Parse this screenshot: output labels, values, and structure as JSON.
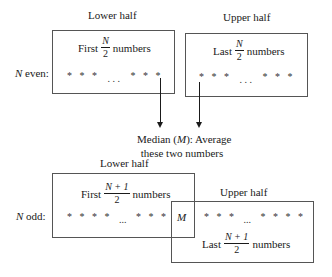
{
  "even": {
    "row_label_var": "N",
    "row_label_rest": " even:",
    "lower": {
      "caption": "Lower half",
      "prefix": "First",
      "frac_num": "N",
      "frac_den": "2",
      "suffix": "numbers",
      "stars_left": "*   *   *",
      "ellipsis": ". . .",
      "stars_right": "*   *   *"
    },
    "upper": {
      "caption": "Upper half",
      "prefix": "Last",
      "frac_num": "N",
      "frac_den": "2",
      "suffix": "numbers",
      "stars_left": "*   *   *",
      "ellipsis": ". . .",
      "stars_right": "*   *   *"
    },
    "median_note_line1_pre": "Median (",
    "median_note_M": "M",
    "median_note_line1_post": "): Average",
    "median_note_line2": "these two numbers"
  },
  "odd": {
    "row_label_var": "N",
    "row_label_rest": " odd:",
    "lower": {
      "caption": "Lower half",
      "prefix": "First",
      "frac_num": "N + 1",
      "frac_den": "2",
      "suffix": "numbers",
      "stars_left": "*   *   *   *",
      "ellipsis": "...",
      "stars_right": "*   *   *"
    },
    "median_symbol": "M",
    "upper": {
      "caption": "Upper half",
      "prefix": "Last",
      "frac_num": "N + 1",
      "frac_den": "2",
      "suffix": "numbers",
      "stars_left": "*   *   *",
      "ellipsis": "...",
      "stars_right": "*   *   *   *"
    }
  }
}
